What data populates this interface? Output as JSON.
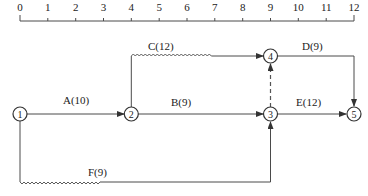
{
  "diagram": {
    "type": "time-scaled network (double-code) diagram",
    "axis": {
      "ticks": [
        "0",
        "1",
        "2",
        "3",
        "4",
        "5",
        "6",
        "7",
        "8",
        "9",
        "10",
        "11",
        "12"
      ]
    },
    "nodes": [
      {
        "id": "1",
        "label": "1",
        "time": 0
      },
      {
        "id": "2",
        "label": "2",
        "time": 4
      },
      {
        "id": "3",
        "label": "3",
        "time": 9
      },
      {
        "id": "4",
        "label": "4",
        "time": 9
      },
      {
        "id": "5",
        "label": "5",
        "time": 12
      }
    ],
    "activities": [
      {
        "name": "A",
        "duration": 10,
        "label": "A(10)",
        "from": "1",
        "to": "2",
        "style": "solid"
      },
      {
        "name": "B",
        "duration": 9,
        "label": "B(9)",
        "from": "2",
        "to": "3",
        "style": "solid"
      },
      {
        "name": "C",
        "duration": 12,
        "label": "C(12)",
        "from": "2",
        "to": "4",
        "style": "solid+free-float-wave"
      },
      {
        "name": "D",
        "duration": 9,
        "label": "D(9)",
        "from": "4",
        "to": "5",
        "style": "solid"
      },
      {
        "name": "E",
        "duration": 12,
        "label": "E(12)",
        "from": "3",
        "to": "5",
        "style": "solid"
      },
      {
        "name": "F",
        "duration": 9,
        "label": "F(9)",
        "from": "1",
        "to": "3",
        "style": "solid+free-float-wave"
      },
      {
        "name": "dummy",
        "label": "",
        "from": "3",
        "to": "4",
        "style": "dashed"
      }
    ]
  }
}
